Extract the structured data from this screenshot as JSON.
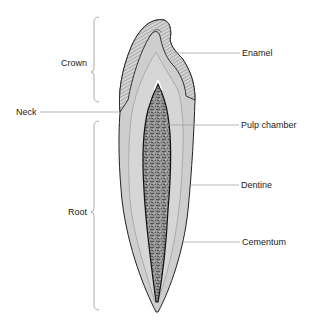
{
  "diagram": {
    "labels": {
      "crown": "Crown",
      "neck": "Neck",
      "root": "Root",
      "enamel": "Enamel",
      "pulp_chamber": "Pulp chamber",
      "dentine": "Dentine",
      "cementum": "Cementum"
    },
    "colors": {
      "line": "#9a9a9a",
      "outline": "#222222",
      "hatch": "#777777",
      "dentine_fill": "#dcdcdc",
      "enamel_fill": "#c8c8c8",
      "pulp_fill": "#6a6a6a",
      "background": "#ffffff"
    }
  }
}
